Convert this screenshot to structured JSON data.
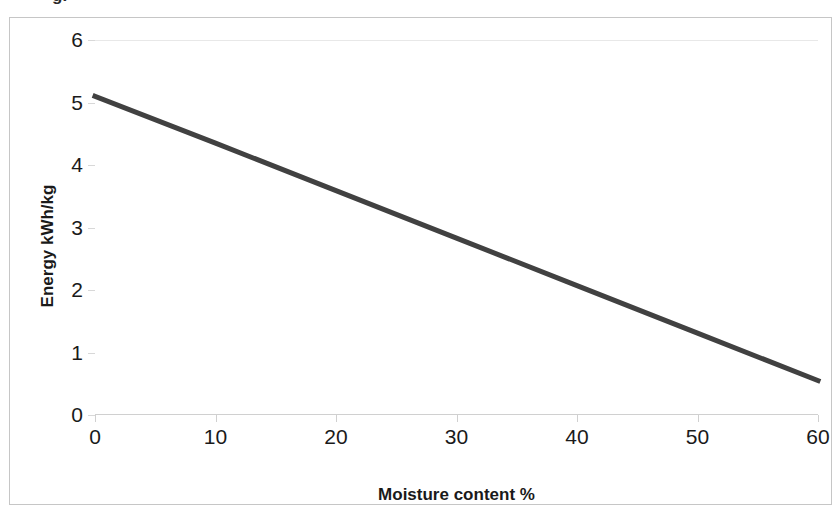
{
  "caption": {
    "partial_text_cut_off": "g."
  },
  "chart_data": {
    "type": "line",
    "title": "",
    "xlabel": "Moisture content %",
    "ylabel": "Energy kWh/kg",
    "xlim": [
      0,
      60
    ],
    "ylim": [
      0,
      6
    ],
    "xticks": [
      0,
      10,
      20,
      30,
      40,
      50,
      60
    ],
    "yticks": [
      0,
      1,
      2,
      3,
      4,
      5,
      6
    ],
    "xtick_labels": [
      "0",
      "10",
      "20",
      "30",
      "40",
      "50",
      "60"
    ],
    "ytick_labels": [
      "0",
      "1",
      "2",
      "3",
      "4",
      "5",
      "6"
    ],
    "grid": "horizontal-top-only",
    "legend": "none",
    "series": [
      {
        "name": "Energy content vs moisture",
        "color": "#414141",
        "line_width": 5,
        "x": [
          0,
          10,
          20,
          30,
          40,
          50,
          60
        ],
        "values": [
          5.1,
          4.35,
          3.59,
          2.83,
          2.07,
          1.31,
          0.55
        ]
      }
    ]
  }
}
